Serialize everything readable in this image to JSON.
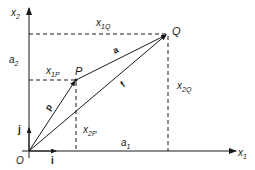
{
  "diagram": {
    "colors": {
      "line": "#1a1a1a",
      "background": "#ffffff"
    },
    "axes": {
      "x1": {
        "label": "x",
        "sub": "1"
      },
      "x2": {
        "label": "x",
        "sub": "2"
      },
      "origin": "O"
    },
    "unit_vectors": {
      "i": "i",
      "j": "j"
    },
    "points": {
      "P": {
        "label": "P"
      },
      "Q": {
        "label": "Q"
      }
    },
    "vectors": {
      "p": "p",
      "a": "a",
      "f": "f"
    },
    "coordinate_labels": {
      "x1Q": {
        "main": "x",
        "sub": "1Q"
      },
      "x1P": {
        "main": "x",
        "sub": "1P"
      },
      "x2Q": {
        "main": "x",
        "sub": "2Q"
      },
      "x2P": {
        "main": "x",
        "sub": "2P"
      },
      "a1": {
        "main": "a",
        "sub": "1"
      },
      "a2": {
        "main": "a",
        "sub": "2"
      }
    }
  }
}
